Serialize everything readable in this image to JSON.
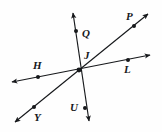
{
  "figure": {
    "type": "geometry-diagram",
    "background_color": "#fefefe",
    "stroke_color": "#16181b"
  },
  "points": [
    {
      "id": "Q",
      "label": "Q",
      "dot_x": 76,
      "dot_y": 31,
      "label_x": 82,
      "label_y": 28
    },
    {
      "id": "P",
      "label": "P",
      "dot_x": 134,
      "dot_y": 26,
      "label_x": 126,
      "label_y": 11
    },
    {
      "id": "J",
      "label": "J",
      "dot_x": 79,
      "dot_y": 70,
      "label_x": 84,
      "label_y": 50
    },
    {
      "id": "H",
      "label": "H",
      "dot_x": 38,
      "dot_y": 77,
      "label_x": 33,
      "label_y": 60
    },
    {
      "id": "L",
      "label": "L",
      "dot_x": 128,
      "dot_y": 60,
      "label_x": 124,
      "label_y": 64
    },
    {
      "id": "U",
      "label": "U",
      "dot_x": 85,
      "dot_y": 108,
      "label_x": 70,
      "label_y": 102
    },
    {
      "id": "Y",
      "label": "Y",
      "dot_x": 34,
      "dot_y": 107,
      "label_x": 34,
      "label_y": 112
    }
  ],
  "lines": [
    {
      "id": "line-QU",
      "name": "vertical-line-Q-J-U",
      "through": [
        "Q",
        "J",
        "U"
      ],
      "x1": 73,
      "y1": 12,
      "x2": 89,
      "y2": 121,
      "arrow_start": true,
      "arrow_end": true
    },
    {
      "id": "line-HL",
      "name": "horizontal-line-H-J-L",
      "through": [
        "H",
        "J",
        "L"
      ],
      "x1": 11,
      "y1": 82,
      "x2": 150,
      "y2": 55,
      "arrow_start": true,
      "arrow_end": true
    },
    {
      "id": "line-YP",
      "name": "diagonal-line-Y-J-P",
      "through": [
        "Y",
        "J",
        "P"
      ],
      "x1": 14,
      "y1": 123,
      "x2": 149,
      "y2": 13,
      "arrow_start": true,
      "arrow_end": true
    }
  ],
  "arrowheads": [
    {
      "id": "arrow-Q-up",
      "x": 74,
      "y": 10
    },
    {
      "id": "arrow-U-down",
      "x": 90,
      "y": 124
    },
    {
      "id": "arrow-H-left",
      "x": 8,
      "y": 83
    },
    {
      "id": "arrow-L-right",
      "x": 153,
      "y": 54
    },
    {
      "id": "arrow-Y-lowleft",
      "x": 11,
      "y": 126
    },
    {
      "id": "arrow-P-upright",
      "x": 152,
      "y": 10
    }
  ]
}
